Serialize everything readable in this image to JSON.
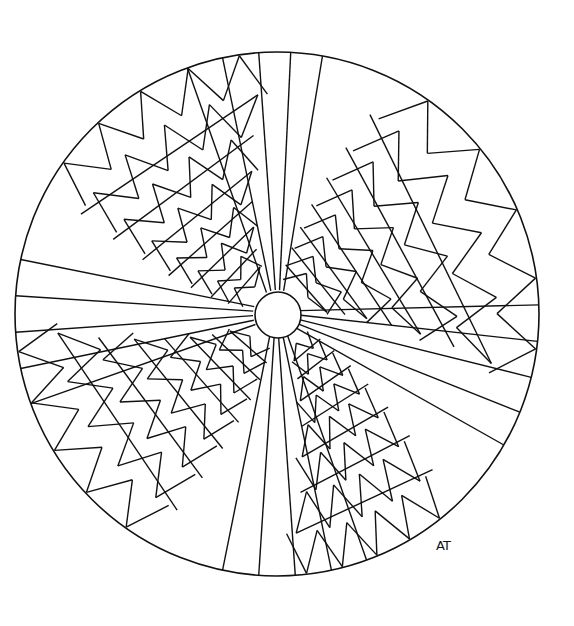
{
  "artwork": {
    "title": "Mandala coloring page",
    "signature": "AT",
    "center": {
      "x": 277,
      "y": 314
    },
    "outer_radius": 262,
    "inner_radius": 23,
    "stroke_color": "#111111",
    "background_color": "#ffffff",
    "ray_fans": [
      {
        "name": "top-fan",
        "angles_deg": [
          -110,
          -102,
          -94,
          -87,
          -80
        ]
      },
      {
        "name": "right-fan",
        "angles_deg": [
          -2,
          6,
          14,
          22,
          30
        ]
      },
      {
        "name": "bottom-fan",
        "angles_deg": [
          70,
          78,
          86,
          94,
          102
        ]
      },
      {
        "name": "left-fan",
        "angles_deg": [
          160,
          168,
          176,
          184,
          192
        ]
      }
    ]
  }
}
